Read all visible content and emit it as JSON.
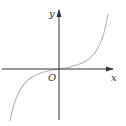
{
  "diagram": {
    "type": "function-graph",
    "axes": {
      "x_label": "x",
      "y_label": "y",
      "origin_label": "O"
    },
    "curve": {
      "shape": "cubic (odd, increasing, inflection at origin)",
      "color": "#b8b8b8"
    },
    "axis_color": "#333333"
  }
}
